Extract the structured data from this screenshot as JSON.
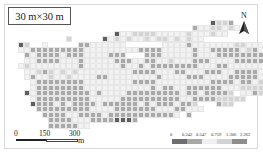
{
  "title": "30 m×30 m",
  "north_arrow": {
    "label": "N"
  },
  "scale_bar": {
    "ticks": [
      "0",
      "150",
      "300"
    ],
    "unit": "m"
  },
  "legend": {
    "breaks": [
      "0",
      "0.242",
      "0.547",
      "0.759",
      "1.306",
      "2.362"
    ],
    "colors": [
      "#6e6e6e",
      "#a8a8a8",
      "#f0f0f0",
      "#d2d2d2",
      "#8e8e8e"
    ]
  },
  "grid": {
    "origin_x": 18,
    "origin_y": 20,
    "cell": 6,
    "class_colors": {
      "1": "#f2f2f2",
      "2": "#d4d4d4",
      "3": "#a9a9a9",
      "4": "#8a8a8a",
      "5": "#5e5e5e"
    },
    "rows": [
      "000000000000000000000000000000000000051220000000",
      "000000000000000000000000000000000002113210000000",
      "000000000000000000000000000000512211221110000000",
      "000000000000000000000000004111121111111000000000",
      "000000000000000000000000005211111111132100000000",
      "000000000000000000021111222111112111113000000000",
      "000000000000000000311123211111221121213310000000",
      "000000000000000000111113111112111333112331000000",
      "000000000000000000111133211311313333113315000000",
      "000000000000000000111333111333313133113312000000",
      "000000000000000000011113131333113333313332100000",
      "000000000000000000011111111333311113311333300000",
      "000000000000000000001133311333333333111132110000",
      "000000000000000000001111111333333333333131200000"
    ],
    "rows_left": [
      "00000000000000000000000000000000000000000000000",
      "00000000000000000000000000000000000000000000000",
      "00000000000000000000000000000000000000000000000",
      "00000000000000000000000000000000000000000000000",
      "00000000000000000000000000000000000000000000000",
      "00000000000000000000000000000000000000000000000"
    ],
    "cells": [
      [
        85,
        5,
        5
      ],
      [
        86,
        5,
        2
      ],
      [
        87,
        5,
        2
      ],
      [
        88,
        5,
        2
      ],
      [
        89,
        5,
        2
      ],
      [
        77,
        6,
        2
      ],
      [
        78,
        6,
        1
      ],
      [
        79,
        6,
        3
      ],
      [
        80,
        6,
        2
      ],
      [
        81,
        6,
        2
      ],
      [
        82,
        6,
        2
      ],
      [
        83,
        6,
        1
      ],
      [
        84,
        6,
        1
      ],
      [
        85,
        6,
        1
      ],
      [
        86,
        6,
        2
      ],
      [
        87,
        6,
        1
      ],
      [
        88,
        6,
        1
      ],
      [
        89,
        6,
        1
      ],
      [
        64,
        7,
        5
      ],
      [
        65,
        7,
        2
      ],
      [
        66,
        7,
        2
      ],
      [
        67,
        7,
        1
      ],
      [
        70,
        7,
        2
      ],
      [
        71,
        7,
        1
      ],
      [
        72,
        7,
        1
      ],
      [
        73,
        7,
        1
      ],
      [
        74,
        7,
        1
      ],
      [
        75,
        7,
        1
      ],
      [
        76,
        7,
        1
      ],
      [
        77,
        7,
        3
      ],
      [
        78,
        7,
        1
      ],
      [
        79,
        7,
        2
      ],
      [
        80,
        7,
        2
      ],
      [
        81,
        7,
        1
      ],
      [
        82,
        7,
        1
      ],
      [
        83,
        7,
        1
      ],
      [
        84,
        7,
        1
      ],
      [
        85,
        7,
        1
      ],
      [
        86,
        7,
        1
      ],
      [
        87,
        7,
        1
      ],
      [
        88,
        7,
        1
      ],
      [
        89,
        7,
        1
      ],
      [
        90,
        7,
        1
      ]
    ]
  }
}
